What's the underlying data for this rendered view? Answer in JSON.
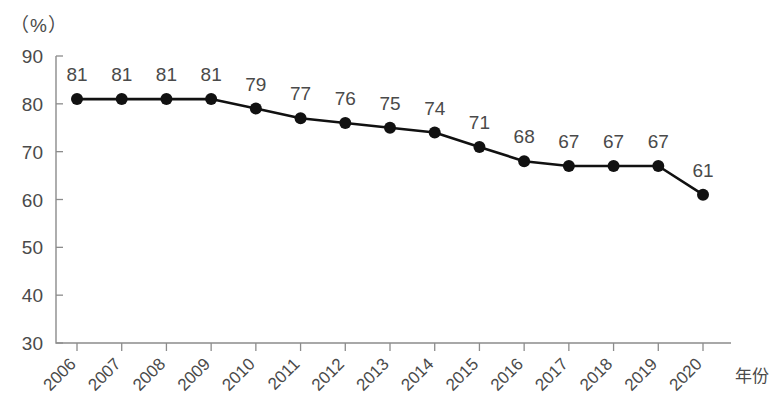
{
  "chart_data": {
    "type": "line",
    "title": "",
    "subtitle": "",
    "xlabel": "年份",
    "ylabel": "（%）",
    "ylim": [
      30,
      90
    ],
    "y_ticks": [
      30,
      40,
      50,
      60,
      70,
      80,
      90
    ],
    "grid": false,
    "legend": null,
    "categories": [
      "2006",
      "2007",
      "2008",
      "2009",
      "2010",
      "2011",
      "2012",
      "2013",
      "2014",
      "2015",
      "2016",
      "2017",
      "2018",
      "2019",
      "2020"
    ],
    "values": [
      81,
      81,
      81,
      81,
      79,
      77,
      76,
      75,
      74,
      71,
      68,
      67,
      67,
      67,
      61
    ],
    "point_labels": [
      "81",
      "81",
      "81",
      "81",
      "79",
      "77",
      "76",
      "75",
      "74",
      "71",
      "68",
      "67",
      "67",
      "67",
      "61"
    ],
    "marker": "filled-circle",
    "line_color": "#111111",
    "marker_color": "#111111",
    "axis_color": "#8c8c8c",
    "text_color": "#4a4a4a",
    "background_color": "#ffffff",
    "x_tick_rotation": -45
  },
  "axis": {
    "unit_label": "（%）",
    "x_title": "年份",
    "y_tick_labels": [
      "90",
      "80",
      "70",
      "60",
      "50",
      "40",
      "30"
    ],
    "x_tick_labels": [
      "2006",
      "2007",
      "2008",
      "2009",
      "2010",
      "2011",
      "2012",
      "2013",
      "2014",
      "2015",
      "2016",
      "2017",
      "2018",
      "2019",
      "2020"
    ]
  }
}
